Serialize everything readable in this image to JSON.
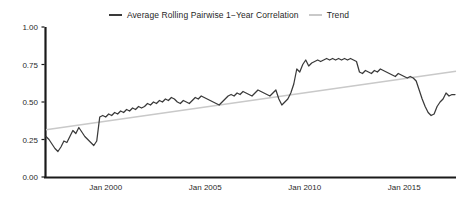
{
  "chart_data": {
    "type": "line",
    "title": "",
    "xlabel": "",
    "ylabel": "",
    "grid": false,
    "legend_position": "top-center",
    "ylim": [
      0.0,
      1.0
    ],
    "yticks": [
      "0.00",
      "0.25",
      "0.50",
      "0.75",
      "1.00"
    ],
    "ytick_values": [
      0.0,
      0.25,
      0.5,
      0.75,
      1.0
    ],
    "xticks": [
      "Jan 2000",
      "Jan 2005",
      "Jan 2010",
      "Jan 2015"
    ],
    "xtick_values": [
      2000.0,
      2005.0,
      2010.0,
      2015.0
    ],
    "xlim": [
      1997.0,
      2017.6
    ],
    "colors": {
      "series": "#3a3a3a",
      "trend": "#c9c9c9",
      "axis": "#1a1a1a",
      "text": "#2a2a2a",
      "background": "#ffffff"
    },
    "series": [
      {
        "name": "Average Rolling Pairwise 1-Year Correlation",
        "color": "#3a3a3a",
        "x": [
          1997.0,
          1997.15,
          1997.3,
          1997.45,
          1997.6,
          1997.75,
          1997.9,
          1998.05,
          1998.2,
          1998.35,
          1998.5,
          1998.65,
          1998.8,
          1998.95,
          1999.1,
          1999.25,
          1999.4,
          1999.55,
          1999.7,
          1999.85,
          2000.0,
          2000.15,
          2000.3,
          2000.45,
          2000.6,
          2000.75,
          2000.9,
          2001.05,
          2001.2,
          2001.35,
          2001.5,
          2001.65,
          2001.8,
          2001.95,
          2002.1,
          2002.25,
          2002.4,
          2002.55,
          2002.7,
          2002.85,
          2003.0,
          2003.15,
          2003.3,
          2003.45,
          2003.6,
          2003.75,
          2003.9,
          2004.05,
          2004.2,
          2004.35,
          2004.5,
          2004.65,
          2004.8,
          2004.95,
          2005.1,
          2005.25,
          2005.4,
          2005.55,
          2005.7,
          2005.85,
          2006.0,
          2006.15,
          2006.3,
          2006.45,
          2006.6,
          2006.75,
          2006.9,
          2007.05,
          2007.2,
          2007.35,
          2007.5,
          2007.65,
          2007.8,
          2007.95,
          2008.1,
          2008.25,
          2008.4,
          2008.55,
          2008.7,
          2008.85,
          2009.0,
          2009.15,
          2009.3,
          2009.45,
          2009.6,
          2009.75,
          2009.9,
          2010.05,
          2010.2,
          2010.35,
          2010.5,
          2010.65,
          2010.8,
          2010.95,
          2011.1,
          2011.25,
          2011.4,
          2011.55,
          2011.7,
          2011.85,
          2012.0,
          2012.15,
          2012.3,
          2012.45,
          2012.6,
          2012.75,
          2012.9,
          2013.05,
          2013.2,
          2013.35,
          2013.5,
          2013.65,
          2013.8,
          2013.95,
          2014.1,
          2014.25,
          2014.4,
          2014.55,
          2014.7,
          2014.85,
          2015.0,
          2015.15,
          2015.3,
          2015.45,
          2015.6,
          2015.75,
          2015.9,
          2016.05,
          2016.2,
          2016.35,
          2016.5,
          2016.65,
          2016.8,
          2016.95,
          2017.1,
          2017.25,
          2017.4,
          2017.55
        ],
        "values": [
          0.27,
          0.25,
          0.22,
          0.19,
          0.17,
          0.2,
          0.24,
          0.23,
          0.27,
          0.31,
          0.29,
          0.33,
          0.3,
          0.27,
          0.25,
          0.23,
          0.21,
          0.24,
          0.4,
          0.41,
          0.4,
          0.42,
          0.41,
          0.43,
          0.42,
          0.44,
          0.43,
          0.45,
          0.44,
          0.46,
          0.45,
          0.47,
          0.46,
          0.47,
          0.49,
          0.48,
          0.5,
          0.49,
          0.51,
          0.5,
          0.52,
          0.51,
          0.53,
          0.52,
          0.5,
          0.49,
          0.51,
          0.5,
          0.49,
          0.51,
          0.53,
          0.52,
          0.54,
          0.53,
          0.52,
          0.51,
          0.5,
          0.49,
          0.48,
          0.5,
          0.52,
          0.54,
          0.55,
          0.54,
          0.56,
          0.55,
          0.57,
          0.56,
          0.55,
          0.54,
          0.56,
          0.58,
          0.57,
          0.56,
          0.55,
          0.54,
          0.56,
          0.58,
          0.52,
          0.48,
          0.5,
          0.52,
          0.56,
          0.62,
          0.72,
          0.7,
          0.75,
          0.78,
          0.74,
          0.76,
          0.77,
          0.78,
          0.77,
          0.78,
          0.79,
          0.78,
          0.79,
          0.78,
          0.79,
          0.78,
          0.79,
          0.78,
          0.79,
          0.78,
          0.77,
          0.7,
          0.69,
          0.71,
          0.7,
          0.69,
          0.71,
          0.7,
          0.72,
          0.71,
          0.7,
          0.69,
          0.68,
          0.67,
          0.69,
          0.68,
          0.67,
          0.66,
          0.67,
          0.66,
          0.64,
          0.58,
          0.52,
          0.47,
          0.43,
          0.41,
          0.42,
          0.47,
          0.5,
          0.52,
          0.56,
          0.54,
          0.55,
          0.55
        ]
      }
    ],
    "trend": {
      "name": "Trend",
      "color": "#c9c9c9",
      "x": [
        1997.0,
        2017.6
      ],
      "values": [
        0.315,
        0.705
      ]
    }
  },
  "legend": {
    "entries": [
      {
        "label": "Average Rolling Pairwise 1−Year Correlation",
        "swatch": "series-line-swatch"
      },
      {
        "label": "Trend",
        "swatch": "trend-line-swatch"
      }
    ]
  },
  "axes": {
    "y": {
      "labels": [
        "1.00",
        "0.75",
        "0.50",
        "0.25",
        "0.00"
      ]
    },
    "x": {
      "labels": [
        "Jan 2000",
        "Jan 2005",
        "Jan 2010",
        "Jan 2015"
      ]
    }
  }
}
